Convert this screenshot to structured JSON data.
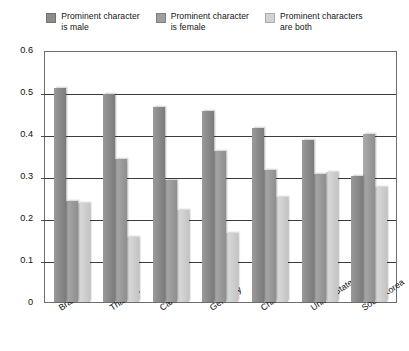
{
  "chart_data": {
    "type": "bar",
    "title": "",
    "xlabel": "",
    "ylabel": "",
    "ylim": [
      0,
      0.6
    ],
    "ytick_values": [
      0,
      0.1,
      0.2,
      0.3,
      0.4,
      0.5,
      0.6
    ],
    "ytick_labels": [
      "0",
      "0.1",
      "0.2",
      "0.3",
      "0.4",
      "0.5",
      "0.6"
    ],
    "grid": true,
    "legend_position": "top",
    "categories": [
      "Brazil",
      "Thailand",
      "Canada",
      "Germany",
      "China",
      "United States",
      "South Korea"
    ],
    "series": [
      {
        "name": "Prominent character is male",
        "color": "#8c8c8c",
        "values": [
          0.51,
          0.495,
          0.465,
          0.455,
          0.415,
          0.385,
          0.3
        ]
      },
      {
        "name": "Prominent character is female",
        "color": "#9e9e9e",
        "values": [
          0.24,
          0.34,
          0.29,
          0.36,
          0.315,
          0.305,
          0.4
        ]
      },
      {
        "name": "Prominent characters are both",
        "color": "#d2d2d2",
        "values": [
          0.235,
          0.155,
          0.22,
          0.165,
          0.25,
          0.31,
          0.275
        ]
      }
    ]
  },
  "legend": {
    "items": [
      {
        "line1": "Prominent character",
        "line2": "is male",
        "color": "#8c8c8c"
      },
      {
        "line1": "Prominent character",
        "line2": "is female",
        "color": "#9e9e9e"
      },
      {
        "line1": "Prominent characters",
        "line2": "are both",
        "color": "#d2d2d2"
      }
    ]
  }
}
